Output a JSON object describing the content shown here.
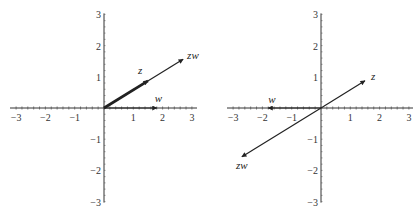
{
  "chart_data": [
    {
      "type": "vector",
      "title": "",
      "xlabel": "",
      "ylabel": "",
      "xlim": [
        -3,
        3
      ],
      "ylim": [
        -3,
        3
      ],
      "x_ticks": [
        "−3",
        "−2",
        "−1",
        "1",
        "2",
        "3"
      ],
      "y_ticks": [
        "3",
        "2",
        "1",
        "−1",
        "−2",
        "−3"
      ],
      "vectors": [
        {
          "name": "z",
          "x": 1.5,
          "y": 0.87
        },
        {
          "name": "w",
          "x": 1.8,
          "y": 0
        },
        {
          "name": "zw",
          "x": 2.7,
          "y": 1.56
        }
      ]
    },
    {
      "type": "vector",
      "title": "",
      "xlabel": "",
      "ylabel": "",
      "xlim": [
        -3,
        3
      ],
      "ylim": [
        -3,
        3
      ],
      "x_ticks": [
        "−3",
        "−2",
        "−1",
        "1",
        "2",
        "3"
      ],
      "y_ticks": [
        "3",
        "2",
        "1",
        "−1",
        "−2",
        "−3"
      ],
      "vectors": [
        {
          "name": "z",
          "x": 1.5,
          "y": 0.87
        },
        {
          "name": "w",
          "x": -1.8,
          "y": 0
        },
        {
          "name": "zw",
          "x": -2.7,
          "y": -1.56
        }
      ]
    }
  ]
}
